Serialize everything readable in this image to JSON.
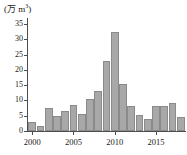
{
  "chart_data": {
    "type": "bar",
    "title": "",
    "subtitle": "",
    "unit_label": "(万 m³)",
    "unit_main": "(万 m",
    "unit_sup": "3",
    "unit_close": ")",
    "xlabel": "",
    "ylabel": "",
    "categories": [
      "2000",
      "2001",
      "2002",
      "2003",
      "2004",
      "2005",
      "2006",
      "2007",
      "2008",
      "2009",
      "2010",
      "2011",
      "2012",
      "2013",
      "2014",
      "2015",
      "2016",
      "2017",
      "2018"
    ],
    "values": [
      3.0,
      1.8,
      7.5,
      4.8,
      6.5,
      8.6,
      5.6,
      10.4,
      13.1,
      23.0,
      32.5,
      15.5,
      8.2,
      5.1,
      4.0,
      8.2,
      8.2,
      9.2,
      4.5
    ],
    "ylim": [
      0,
      36
    ],
    "y_ticks": [
      0,
      5,
      10,
      15,
      20,
      25,
      30,
      35
    ],
    "y_tick_labels": [
      "0",
      "5",
      "10",
      "15",
      "20",
      "25",
      "30",
      "35"
    ],
    "x_tick_labels": [
      "2000",
      "2005",
      "2010",
      "2015"
    ],
    "x_tick_categories": [
      "2000",
      "2005",
      "2010",
      "2015"
    ],
    "grid": false,
    "legend": null,
    "bar_color": "#a8a8a8",
    "bar_edge_color": "#8a8a8a",
    "axis_color": "#4d4d4d",
    "text_color": "#1a1a1a",
    "background_color": "#ffffff"
  }
}
